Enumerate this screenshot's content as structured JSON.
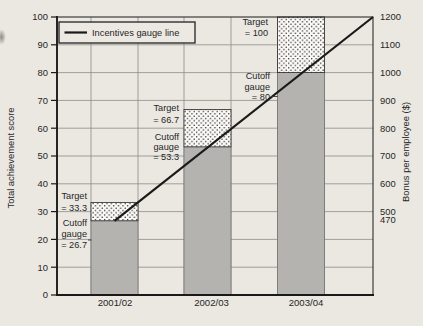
{
  "figure": {
    "legend": {
      "label": "Incentives gauge line"
    },
    "left_axis": {
      "title": "Total achievement score"
    },
    "right_axis": {
      "title": "Bonus per employee ($)"
    },
    "annotations": [
      {
        "id": "target-2001-02",
        "lines": [
          "Target",
          "= 33.3"
        ]
      },
      {
        "id": "cutoff-2001-02",
        "lines": [
          "Cutoff",
          "gauge",
          "= 26.7"
        ]
      },
      {
        "id": "target-2002-03",
        "lines": [
          "Target",
          "= 66.7"
        ]
      },
      {
        "id": "cutoff-2002-03",
        "lines": [
          "Cutoff",
          "gauge",
          "= 53.3"
        ]
      },
      {
        "id": "target-2003-04",
        "lines": [
          "Target",
          "= 100"
        ]
      },
      {
        "id": "cutoff-2003-04",
        "lines": [
          "Cutoff",
          "gauge",
          "= 80"
        ]
      }
    ]
  },
  "chart_data": {
    "type": "bar",
    "categories": [
      "2001/02",
      "2002/03",
      "2003/04"
    ],
    "series": [
      {
        "name": "Cutoff gauge (solid grey bar)",
        "style": "solid-grey",
        "values": [
          26.7,
          53.3,
          80
        ]
      },
      {
        "name": "Target (dotted cap, bar top)",
        "style": "dotted",
        "values": [
          33.3,
          66.7,
          100
        ]
      }
    ],
    "line": {
      "name": "Incentives gauge line",
      "points": [
        {
          "category": "2001/02",
          "score": 26.7,
          "bonus": 470
        },
        {
          "category": "2002/03",
          "score": 53.3
        },
        {
          "category": "2003/04",
          "score": 80,
          "bonus": 1000
        },
        {
          "category": "right-axis-end",
          "score": 100,
          "bonus": 1200
        }
      ]
    },
    "title": "",
    "xlabel": "",
    "ylabel": "Total achievement score",
    "ylabel_right": "Bonus per employee ($)",
    "ylim": [
      0,
      100
    ],
    "yticks": [
      0,
      10,
      20,
      30,
      40,
      50,
      60,
      70,
      80,
      90,
      100
    ],
    "yticks_right": [
      470,
      500,
      600,
      700,
      800,
      900,
      1000,
      1100,
      1200
    ],
    "right_axis_labeled_range": [
      470,
      1200
    ],
    "grid": {
      "horizontal": "every 10 score units",
      "vertical": "at bar edges only"
    },
    "legend_position": "top-left inside plot"
  }
}
